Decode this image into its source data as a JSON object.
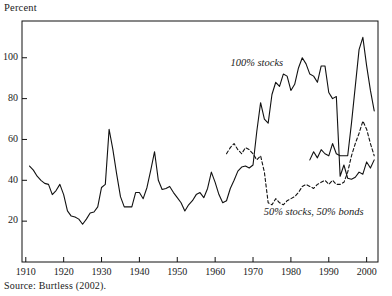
{
  "figure": {
    "axis_label": "Percent",
    "source_note": "Source: Burtless (2002)."
  },
  "chart_data": {
    "type": "line",
    "title": "",
    "xlabel": "",
    "ylabel": "Percent",
    "xlim": [
      1909,
      2003
    ],
    "ylim": [
      0,
      118
    ],
    "xticks": [
      1910,
      1920,
      1930,
      1940,
      1950,
      1960,
      1970,
      1980,
      1990,
      2000
    ],
    "yticks": [
      20,
      40,
      60,
      80,
      100
    ],
    "grid": false,
    "legend": "annotations-on-plot",
    "annotations": [
      {
        "text": "100% stocks",
        "x": 1971,
        "y": 96,
        "style": "italic"
      },
      {
        "text": "50% stocks, 50% bonds",
        "x": 1986,
        "y": 23,
        "style": "italic"
      }
    ],
    "series": [
      {
        "name": "100% stocks",
        "style": "solid",
        "x": [
          1911,
          1912,
          1913,
          1914,
          1915,
          1916,
          1917,
          1918,
          1919,
          1920,
          1921,
          1922,
          1923,
          1924,
          1925,
          1926,
          1927,
          1928,
          1929,
          1930,
          1931,
          1932,
          1933,
          1934,
          1935,
          1936,
          1937,
          1938,
          1939,
          1940,
          1941,
          1942,
          1943,
          1944,
          1945,
          1946,
          1947,
          1948,
          1949,
          1950,
          1951,
          1952,
          1953,
          1954,
          1955,
          1956,
          1957,
          1958,
          1959,
          1960,
          1961,
          1962,
          1963,
          1964,
          1965,
          1966,
          1967,
          1968,
          1969,
          1970,
          1971,
          1972,
          1973,
          1974,
          1975,
          1976,
          1977,
          1978,
          1979,
          1980,
          1981,
          1982,
          1983,
          1984,
          1985,
          1986,
          1987,
          1988,
          1989,
          1990,
          1991,
          1992,
          1993,
          1994,
          1995,
          1996,
          1997,
          1998,
          1999,
          2000,
          2001,
          2002
        ],
        "y": [
          47,
          45,
          42,
          40,
          38.5,
          38,
          33,
          35,
          38,
          33,
          25,
          22.5,
          22,
          21,
          18.5,
          21,
          24,
          24.5,
          27,
          36.5,
          38,
          65,
          55,
          43,
          32,
          27,
          27,
          27,
          34,
          34,
          31,
          36.5,
          45,
          54,
          40,
          35.5,
          36,
          37,
          34,
          31.5,
          29,
          25,
          28,
          30,
          33,
          34,
          31.5,
          36,
          44,
          39,
          33,
          29,
          30,
          36,
          40,
          44.5,
          46.5,
          47,
          46,
          47.5,
          64,
          78,
          70,
          68,
          82,
          88,
          86,
          92,
          91,
          84,
          87,
          95,
          100,
          97,
          92,
          91,
          88,
          96,
          96,
          83,
          80,
          81,
          42,
          47.5,
          41,
          40.5,
          41.5,
          44,
          43,
          49,
          46,
          50
        ]
      },
      {
        "name": "100% stocks (cont.)",
        "style": "solid-continued",
        "x": [
          1985,
          1986,
          1987,
          1988,
          1989,
          1990,
          1991,
          1992,
          1993,
          1994,
          1995,
          1996,
          1997,
          1998,
          1999,
          2000,
          2001,
          2002
        ],
        "y": [
          50,
          54,
          51,
          55,
          53,
          52,
          58,
          53,
          52,
          52,
          52,
          68,
          86,
          104,
          110,
          96,
          84,
          74
        ]
      },
      {
        "name": "50% stocks, 50% bonds",
        "style": "dashed",
        "x": [
          1963,
          1964,
          1965,
          1966,
          1967,
          1968,
          1969,
          1970,
          1971,
          1972,
          1973,
          1974,
          1975,
          1976,
          1977,
          1978,
          1979,
          1980,
          1981,
          1982,
          1983,
          1984,
          1985,
          1986,
          1987,
          1988,
          1989,
          1990,
          1991,
          1992,
          1993,
          1994,
          1995,
          1996,
          1997,
          1998,
          1999,
          2000,
          2001,
          2002
        ],
        "y": [
          53,
          56,
          58,
          55,
          53,
          56,
          55,
          53,
          50,
          52,
          44,
          29,
          28,
          31,
          29,
          28,
          30,
          31,
          32,
          34,
          37,
          38,
          37,
          36,
          38,
          39,
          40,
          38,
          40,
          38,
          38,
          39,
          44,
          52,
          58,
          63,
          69,
          65,
          58,
          52
        ]
      }
    ]
  }
}
